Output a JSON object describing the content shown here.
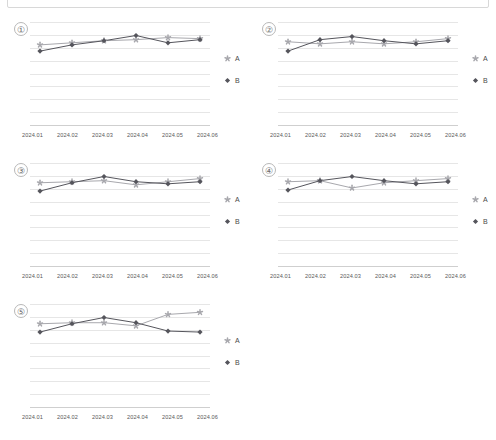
{
  "top_frame": {
    "name": "empty-toolbar-frame"
  },
  "legend": {
    "series": [
      {
        "key": "A",
        "label": "A",
        "marker": "star-icon",
        "color": "#a8a8ad"
      },
      {
        "key": "B",
        "label": "B",
        "marker": "diamond-icon",
        "color": "#55555c"
      }
    ]
  },
  "axis": {
    "categories": [
      "2024.01",
      "2024.02",
      "2024.03",
      "2024.04",
      "2024.05",
      "2024.06"
    ],
    "gridline_count": 9
  },
  "panels": [
    {
      "index": "①"
    },
    {
      "index": "②"
    },
    {
      "index": "③"
    },
    {
      "index": "④"
    },
    {
      "index": "⑤"
    }
  ],
  "chart_data": [
    {
      "type": "line",
      "title": "①",
      "xlabel": "",
      "ylabel": "",
      "grid": true,
      "legend_position": "right",
      "categories": [
        "2024.01",
        "2024.02",
        "2024.03",
        "2024.04",
        "2024.05",
        "2024.06"
      ],
      "ylim": [
        0,
        100
      ],
      "series": [
        {
          "name": "A",
          "color": "#a8a8ad",
          "marker": "star",
          "values": [
            78,
            80,
            82,
            83,
            85,
            84
          ]
        },
        {
          "name": "B",
          "color": "#55555c",
          "marker": "diamond",
          "values": [
            72,
            78,
            82,
            87,
            80,
            83
          ]
        }
      ]
    },
    {
      "type": "line",
      "title": "②",
      "xlabel": "",
      "ylabel": "",
      "grid": true,
      "legend_position": "right",
      "categories": [
        "2024.01",
        "2024.02",
        "2024.03",
        "2024.04",
        "2024.05",
        "2024.06"
      ],
      "ylim": [
        0,
        100
      ],
      "series": [
        {
          "name": "A",
          "color": "#a8a8ad",
          "marker": "star",
          "values": [
            81,
            79,
            81,
            79,
            81,
            84
          ]
        },
        {
          "name": "B",
          "color": "#55555c",
          "marker": "diamond",
          "values": [
            72,
            83,
            86,
            82,
            79,
            82
          ]
        }
      ]
    },
    {
      "type": "line",
      "title": "③",
      "xlabel": "",
      "ylabel": "",
      "grid": true,
      "legend_position": "right",
      "categories": [
        "2024.01",
        "2024.02",
        "2024.03",
        "2024.04",
        "2024.05",
        "2024.06"
      ],
      "ylim": [
        0,
        100
      ],
      "series": [
        {
          "name": "A",
          "color": "#a8a8ad",
          "marker": "star",
          "values": [
            81,
            82,
            83,
            79,
            82,
            85
          ]
        },
        {
          "name": "B",
          "color": "#55555c",
          "marker": "diamond",
          "values": [
            73,
            81,
            87,
            82,
            80,
            82
          ]
        }
      ]
    },
    {
      "type": "line",
      "title": "④",
      "xlabel": "",
      "ylabel": "",
      "grid": true,
      "legend_position": "right",
      "categories": [
        "2024.01",
        "2024.02",
        "2024.03",
        "2024.04",
        "2024.05",
        "2024.06"
      ],
      "ylim": [
        0,
        100
      ],
      "series": [
        {
          "name": "A",
          "color": "#a8a8ad",
          "marker": "star",
          "values": [
            82,
            83,
            76,
            81,
            83,
            85
          ]
        },
        {
          "name": "B",
          "color": "#55555c",
          "marker": "diamond",
          "values": [
            74,
            83,
            87,
            83,
            80,
            82
          ]
        }
      ]
    },
    {
      "type": "line",
      "title": "⑤",
      "xlabel": "",
      "ylabel": "",
      "grid": true,
      "legend_position": "right",
      "categories": [
        "2024.01",
        "2024.02",
        "2024.03",
        "2024.04",
        "2024.05",
        "2024.06"
      ],
      "ylim": [
        0,
        100
      ],
      "series": [
        {
          "name": "A",
          "color": "#a8a8ad",
          "marker": "star",
          "values": [
            81,
            82,
            82,
            79,
            90,
            92
          ]
        },
        {
          "name": "B",
          "color": "#55555c",
          "marker": "diamond",
          "values": [
            73,
            81,
            87,
            82,
            74,
            73
          ]
        }
      ]
    }
  ]
}
